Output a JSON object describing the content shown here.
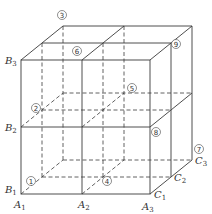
{
  "figure": {
    "axis_labels": {
      "A": [
        "A1",
        "A2",
        "A3"
      ],
      "B": [
        "B1",
        "B2",
        "B3"
      ],
      "C": [
        "C1",
        "C2",
        "C3"
      ]
    },
    "labels": [
      {
        "id": "B3",
        "letter": "B",
        "sub": "3"
      },
      {
        "id": "B2",
        "letter": "B",
        "sub": "2"
      },
      {
        "id": "B1",
        "letter": "B",
        "sub": "1"
      },
      {
        "id": "A1",
        "letter": "A",
        "sub": "1"
      },
      {
        "id": "A2",
        "letter": "A",
        "sub": "2"
      },
      {
        "id": "A3",
        "letter": "A",
        "sub": "3"
      },
      {
        "id": "C1",
        "letter": "C",
        "sub": "1"
      },
      {
        "id": "C2",
        "letter": "C",
        "sub": "2"
      },
      {
        "id": "C3",
        "letter": "C",
        "sub": "3"
      }
    ],
    "circled_numbers": [
      "①",
      "②",
      "③",
      "④",
      "⑤",
      "⑥",
      "⑦",
      "⑧",
      "⑨"
    ]
  }
}
